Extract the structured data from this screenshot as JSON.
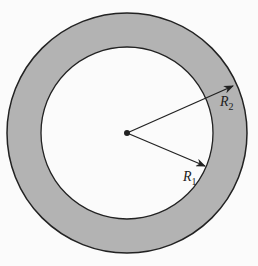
{
  "diagram": {
    "type": "annulus",
    "colors": {
      "ring": "#b3b3b3",
      "inner": "#fbfbfb",
      "stroke": "#222222"
    },
    "labels": {
      "r1": {
        "base": "R",
        "sub": "1"
      },
      "r2": {
        "base": "R",
        "sub": "2"
      }
    }
  }
}
